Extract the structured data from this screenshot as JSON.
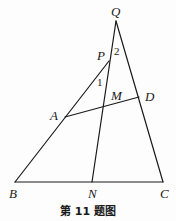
{
  "figure": {
    "caption": "第 11 题图",
    "points": {
      "Q": {
        "label": "Q",
        "x": 116,
        "y": 21,
        "lx": 111,
        "ly": 16
      },
      "P": {
        "label": "P",
        "x": 109,
        "y": 61,
        "lx": 97,
        "ly": 60
      },
      "D": {
        "label": "D",
        "x": 139,
        "y": 97,
        "lx": 145,
        "ly": 101
      },
      "M": {
        "label": "M",
        "x": 103,
        "y": 108,
        "lx": 111,
        "ly": 100
      },
      "A": {
        "label": "A",
        "x": 65,
        "y": 117,
        "lx": 50,
        "ly": 120
      },
      "B": {
        "label": "B",
        "x": 15,
        "y": 182,
        "lx": 9,
        "ly": 198
      },
      "N": {
        "label": "N",
        "x": 92,
        "y": 182,
        "lx": 88,
        "ly": 198
      },
      "C": {
        "label": "C",
        "x": 163,
        "y": 182,
        "lx": 160,
        "ly": 198
      }
    },
    "angles": {
      "angle1": {
        "label": "1",
        "x": 97,
        "y": 86
      },
      "angle2": {
        "label": "2",
        "x": 114,
        "y": 55
      }
    },
    "segments": [
      [
        "B",
        "C"
      ],
      [
        "B",
        "A"
      ],
      [
        "A",
        "P"
      ],
      [
        "Q",
        "C"
      ],
      [
        "Q",
        "N"
      ],
      [
        "A",
        "D"
      ]
    ]
  }
}
